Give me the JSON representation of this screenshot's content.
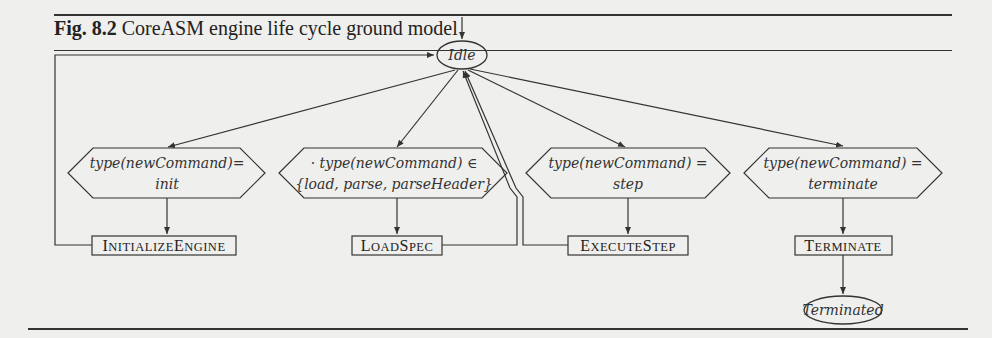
{
  "figure": {
    "label": "Fig. 8.2",
    "title": "CoreASM engine life cycle ground model"
  },
  "nodes": {
    "idle": "Idle",
    "terminated": "Terminated"
  },
  "guards": [
    {
      "line1": "type(newCommand)=",
      "line2": "init"
    },
    {
      "line1": "· type(newCommand) ∈",
      "line2": "{load, parse, parseHeader}"
    },
    {
      "line1": "type(newCommand) =",
      "line2": "step"
    },
    {
      "line1": "type(newCommand) =",
      "line2": "terminate"
    }
  ],
  "rules": [
    {
      "cap1": "I",
      "rest1": "NITIALIZE",
      "cap2": "E",
      "rest2": "NGINE"
    },
    {
      "cap1": "L",
      "rest1": "OAD",
      "cap2": "S",
      "rest2": "PEC"
    },
    {
      "cap1": "E",
      "rest1": "XECUTE",
      "cap2": "S",
      "rest2": "TEP"
    },
    {
      "cap1": "T",
      "rest1": "ERMINATE",
      "cap2": "",
      "rest2": ""
    }
  ]
}
